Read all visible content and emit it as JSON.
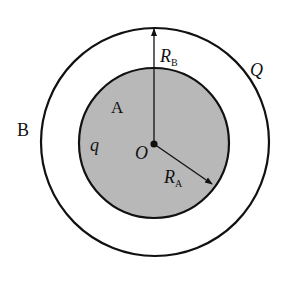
{
  "diagram": {
    "colors": {
      "stroke": "#111111",
      "inner_fill": "#b8b8b8",
      "background": "#ffffff"
    },
    "center": {
      "x": 155,
      "y": 143
    },
    "outer_shell": {
      "label": "B",
      "charge_label": "Q",
      "radius": 114
    },
    "inner_sphere": {
      "label": "A",
      "charge_label": "q",
      "radius": 75
    },
    "center_label": "O",
    "radius_labels": {
      "outer": {
        "main": "R",
        "sub": "B"
      },
      "inner": {
        "main": "R",
        "sub": "A"
      }
    }
  }
}
